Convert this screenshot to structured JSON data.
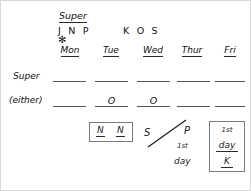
{
  "diagram": {
    "title": "Super",
    "initials_left": "J N P",
    "initials_right": "K O S",
    "asterisk": "✻",
    "columns": [
      {
        "key": "mon",
        "label": "Mon"
      },
      {
        "key": "tue",
        "label": "Tue"
      },
      {
        "key": "wed",
        "label": "Wed"
      },
      {
        "key": "thur",
        "label": "Thur"
      },
      {
        "key": "fri",
        "label": "Fri"
      }
    ],
    "rows": [
      {
        "key": "super",
        "label": "Super",
        "cells": [
          "",
          "",
          "",
          "",
          ""
        ]
      },
      {
        "key": "either",
        "label": "(either)",
        "cells": [
          "",
          "O",
          "O",
          "",
          ""
        ]
      }
    ],
    "nn_box": {
      "left_letter": "N",
      "right_letter": "N"
    },
    "sp_note": {
      "left_letter": "S",
      "right_letter": "P",
      "ordinal": "1st",
      "day_word": "day"
    },
    "fri_box": {
      "ordinal": "1st",
      "day_word": "day",
      "letter": "K"
    }
  },
  "colors": {
    "ink": "#111111",
    "rule": "#555555",
    "box_border": "#7a7a7a",
    "frame": "#d8d8d8",
    "background": "#ffffff"
  }
}
